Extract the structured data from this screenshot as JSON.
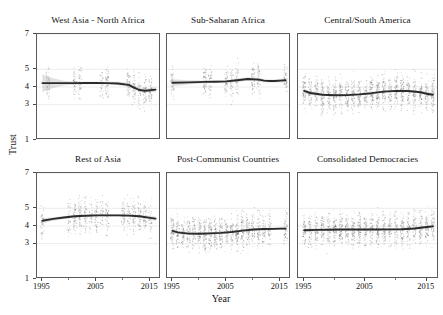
{
  "figure": {
    "xlabel": "Year",
    "ylabel": "Trust"
  },
  "chart_data": {
    "type": "scatter",
    "title": "",
    "xlabel": "Year",
    "ylabel": "Trust",
    "xlim": [
      1994,
      2017
    ],
    "ylim": [
      1,
      7
    ],
    "xticks": [
      1995,
      2005,
      2015
    ],
    "xtick_labels": [
      "1995",
      "2005",
      "2015"
    ],
    "xticks_minor": [
      2000,
      2010
    ],
    "yticks": [
      1,
      3,
      4,
      5,
      7
    ],
    "ytick_labels": [
      "1",
      "3",
      "4",
      "5",
      "7"
    ],
    "grid": false,
    "legend": null,
    "layout": "2 rows x 3 columns of small-multiple panels",
    "overlay": "LOESS/GAM smoothed trend line with shaded 95% confidence band over jittered observation points",
    "panels": [
      {
        "title": "West Asia - North Africa",
        "row": 0,
        "col": 0,
        "trend_x": [
          1995,
          1997,
          1999,
          2001,
          2003,
          2005,
          2007,
          2009,
          2011,
          2012,
          2013,
          2014,
          2015,
          2016
        ],
        "trend_y": [
          4.22,
          4.22,
          4.22,
          4.22,
          4.23,
          4.23,
          4.22,
          4.2,
          4.12,
          3.97,
          3.83,
          3.79,
          3.82,
          3.85
        ],
        "ci_low": [
          3.72,
          3.95,
          4.08,
          4.14,
          4.16,
          4.16,
          4.14,
          4.1,
          4.0,
          3.86,
          3.72,
          3.67,
          3.7,
          3.7
        ],
        "ci_high": [
          4.72,
          4.49,
          4.36,
          4.3,
          4.3,
          4.3,
          4.3,
          4.3,
          4.24,
          4.08,
          3.94,
          3.91,
          3.94,
          4.0
        ],
        "point_years": [
          1996,
          2001,
          2002,
          2006,
          2007,
          2011,
          2012,
          2013,
          2014,
          2015
        ],
        "point_density": "moderate; columns span roughly 1.5 to 6.2 on the Trust scale"
      },
      {
        "title": "Sub-Saharan Africa",
        "row": 0,
        "col": 1,
        "trend_x": [
          1995,
          1998,
          2001,
          2003,
          2005,
          2007,
          2009,
          2011,
          2012,
          2013,
          2014,
          2015,
          2016
        ],
        "trend_y": [
          4.24,
          4.26,
          4.29,
          4.3,
          4.32,
          4.38,
          4.45,
          4.42,
          4.36,
          4.34,
          4.34,
          4.36,
          4.38
        ],
        "ci_low": [
          4.04,
          4.14,
          4.21,
          4.22,
          4.24,
          4.29,
          4.35,
          4.32,
          4.27,
          4.25,
          4.25,
          4.26,
          4.26
        ],
        "ci_high": [
          4.44,
          4.38,
          4.37,
          4.38,
          4.4,
          4.47,
          4.55,
          4.52,
          4.45,
          4.43,
          4.43,
          4.46,
          4.5
        ],
        "point_years": [
          1995,
          2001,
          2002,
          2005,
          2006,
          2007,
          2010,
          2011,
          2016
        ],
        "point_density": "moderate; columns span roughly 2.2 to 5.6"
      },
      {
        "title": "Central/South America",
        "row": 0,
        "col": 2,
        "trend_x": [
          1995,
          1996,
          1998,
          2000,
          2002,
          2004,
          2006,
          2008,
          2010,
          2012,
          2014,
          2015,
          2016
        ],
        "trend_y": [
          3.78,
          3.66,
          3.56,
          3.53,
          3.54,
          3.58,
          3.65,
          3.74,
          3.78,
          3.77,
          3.7,
          3.62,
          3.56
        ],
        "ci_low": [
          3.64,
          3.56,
          3.49,
          3.47,
          3.48,
          3.52,
          3.59,
          3.68,
          3.72,
          3.7,
          3.62,
          3.52,
          3.44
        ],
        "ci_high": [
          3.92,
          3.76,
          3.63,
          3.59,
          3.6,
          3.64,
          3.71,
          3.8,
          3.84,
          3.84,
          3.78,
          3.72,
          3.68
        ],
        "point_years": [
          1995,
          1996,
          1997,
          1998,
          1999,
          2000,
          2001,
          2002,
          2003,
          2004,
          2005,
          2006,
          2007,
          2008,
          2009,
          2010,
          2011,
          2012,
          2013,
          2014,
          2015,
          2016
        ],
        "point_density": "very dense; columns span roughly 1.3 to 6.5 at nearly every year"
      },
      {
        "title": "Rest of Asia",
        "row": 1,
        "col": 0,
        "trend_x": [
          1995,
          1997,
          1999,
          2001,
          2003,
          2005,
          2007,
          2009,
          2011,
          2013,
          2015,
          2016
        ],
        "trend_y": [
          4.3,
          4.4,
          4.48,
          4.55,
          4.58,
          4.6,
          4.6,
          4.6,
          4.59,
          4.55,
          4.46,
          4.42
        ],
        "ci_low": [
          4.16,
          4.3,
          4.4,
          4.48,
          4.52,
          4.54,
          4.54,
          4.54,
          4.52,
          4.47,
          4.36,
          4.3
        ],
        "ci_high": [
          4.44,
          4.5,
          4.56,
          4.62,
          4.64,
          4.66,
          4.66,
          4.66,
          4.66,
          4.63,
          4.56,
          4.54
        ],
        "point_years": [
          1995,
          2000,
          2001,
          2002,
          2003,
          2004,
          2005,
          2006,
          2007,
          2010,
          2011,
          2012,
          2013,
          2014,
          2015
        ],
        "point_density": "dense around 2003-2006; columns span roughly 1.8 to 6.6"
      },
      {
        "title": "Post-Communist Countries",
        "row": 1,
        "col": 1,
        "trend_x": [
          1995,
          1996,
          1998,
          2000,
          2002,
          2004,
          2006,
          2008,
          2010,
          2012,
          2014,
          2015,
          2016
        ],
        "trend_y": [
          3.72,
          3.64,
          3.57,
          3.56,
          3.58,
          3.61,
          3.66,
          3.74,
          3.8,
          3.83,
          3.84,
          3.85,
          3.85
        ],
        "ci_low": [
          3.58,
          3.54,
          3.5,
          3.49,
          3.51,
          3.55,
          3.6,
          3.68,
          3.74,
          3.77,
          3.77,
          3.77,
          3.76
        ],
        "ci_high": [
          3.86,
          3.74,
          3.64,
          3.63,
          3.65,
          3.67,
          3.72,
          3.8,
          3.86,
          3.89,
          3.91,
          3.93,
          3.94
        ],
        "point_years": [
          1995,
          1996,
          1997,
          1998,
          1999,
          2000,
          2001,
          2002,
          2003,
          2004,
          2005,
          2006,
          2007,
          2008,
          2009,
          2010,
          2011,
          2012,
          2013,
          2016
        ],
        "point_density": "dense; columns span roughly 1.4 to 6.0"
      },
      {
        "title": "Consolidated Democracies",
        "row": 1,
        "col": 2,
        "trend_x": [
          1995,
          1997,
          1999,
          2001,
          2003,
          2005,
          2007,
          2009,
          2011,
          2013,
          2015,
          2016
        ],
        "trend_y": [
          3.76,
          3.78,
          3.79,
          3.8,
          3.8,
          3.8,
          3.8,
          3.81,
          3.82,
          3.86,
          3.94,
          3.98
        ],
        "ci_low": [
          3.66,
          3.7,
          3.73,
          3.74,
          3.75,
          3.75,
          3.75,
          3.75,
          3.76,
          3.79,
          3.86,
          3.88
        ],
        "ci_high": [
          3.86,
          3.86,
          3.85,
          3.86,
          3.85,
          3.85,
          3.85,
          3.87,
          3.88,
          3.93,
          4.02,
          4.08
        ],
        "point_years": [
          1995,
          1996,
          1997,
          1998,
          1999,
          2000,
          2001,
          2002,
          2003,
          2004,
          2005,
          2006,
          2007,
          2008,
          2009,
          2010,
          2011,
          2012,
          2013,
          2014,
          2015,
          2016
        ],
        "point_density": "very dense; columns span roughly 1.5 to 6.2"
      }
    ]
  }
}
